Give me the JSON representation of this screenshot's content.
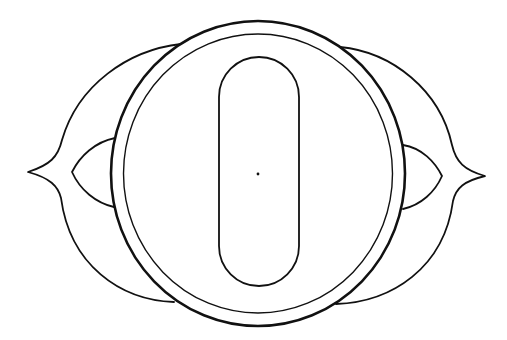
{
  "diagram": {
    "description": "Line drawing of a round object with an oblong slot, flanked by two pointed wing-like lobes",
    "background": "#ffffff",
    "stroke_color": "#111111",
    "outer_ring": {
      "cx": 258,
      "cy": 173.5,
      "rx": 147,
      "ry": 152.5,
      "stroke_width": 2.6
    },
    "inner_ring": {
      "cx": 258,
      "cy": 173.5,
      "rx": 134.5,
      "ry": 139.5,
      "stroke_width": 1.4
    },
    "slot": {
      "x": 219,
      "y": 57,
      "width": 80,
      "height": 229,
      "stroke_width": 1.8
    },
    "center_dot": {
      "cx": 258,
      "cy": 174,
      "r": 1.4
    },
    "wings": {
      "left_tip": [
        28,
        172
      ],
      "right_tip": [
        485,
        176
      ]
    },
    "lenses": {
      "left_tip": [
        72,
        172
      ],
      "right_tip": [
        442,
        176
      ]
    }
  }
}
